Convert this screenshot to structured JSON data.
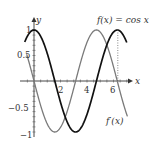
{
  "chart_data": {
    "type": "line",
    "title": "",
    "xlabel": "x",
    "ylabel": "y",
    "xlim": [
      -0.6,
      7.1
    ],
    "ylim": [
      -1.1,
      1.15
    ],
    "x_ticks": [
      "2",
      "4",
      "6"
    ],
    "y_ticks": [
      "1",
      "0.5",
      "-0.5",
      "-1"
    ],
    "series": [
      {
        "name": "f(x) = cos x",
        "function": "cos(x)",
        "color": "#111111",
        "stroke_width": 1.6
      },
      {
        "name": "f'(x)",
        "function": "-sin(x)",
        "color": "#777777",
        "stroke_width": 1.2
      }
    ],
    "annotations": [
      {
        "text": "f(x) = cos x",
        "position": "top-right"
      },
      {
        "text": "f'(x)",
        "position": "bottom-right"
      },
      {
        "type": "dotted-vertical-line",
        "x": 6.283
      }
    ]
  },
  "labels": {
    "x_axis": "x",
    "y_axis": "y",
    "f_label": "f(x) = cos x",
    "fprime_label": "f′(x)",
    "tick_x2": "2",
    "tick_x4": "4",
    "tick_x6": "6",
    "tick_y1": "1",
    "tick_y05": "0.5",
    "tick_yn05": "−0.5",
    "tick_yn1": "−1"
  }
}
